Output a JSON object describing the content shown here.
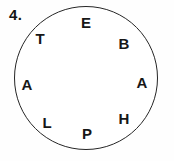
{
  "figure": {
    "item_number": "4.",
    "puzzle": {
      "type": "letter-circle",
      "circle": {
        "stroke_color": "#262626",
        "fill_color": "#ffffff"
      },
      "letters": [
        {
          "char": "E",
          "position": "top"
        },
        {
          "char": "B",
          "position": "upper-right"
        },
        {
          "char": "A",
          "position": "right"
        },
        {
          "char": "H",
          "position": "lower-right"
        },
        {
          "char": "P",
          "position": "bottom"
        },
        {
          "char": "L",
          "position": "lower-left"
        },
        {
          "char": "A",
          "position": "left"
        },
        {
          "char": "T",
          "position": "upper-left"
        }
      ]
    }
  }
}
